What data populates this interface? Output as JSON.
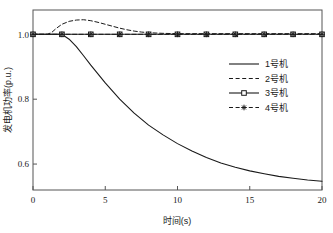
{
  "chart_data": {
    "type": "line",
    "title": "",
    "xlabel": "时间(s)",
    "ylabel": "发电机功率(p.u.)",
    "xlim": [
      0,
      20
    ],
    "ylim": [
      0.52,
      1.075
    ],
    "xticks": [
      0,
      5,
      10,
      15,
      20
    ],
    "xtick_labels": [
      "0",
      "5",
      "10",
      "15",
      "20"
    ],
    "yticks": [
      0.6,
      0.8,
      1.0
    ],
    "ytick_labels": [
      "0.6",
      "0.8",
      "1.0"
    ],
    "grid": false,
    "legend_position": "center-right",
    "series": [
      {
        "name": "1号机",
        "style": "solid",
        "marker": "none",
        "color": "#1a1a1a",
        "x": [
          0,
          1,
          1.5,
          2,
          2.5,
          3,
          3.5,
          4,
          5,
          6,
          7,
          8,
          9,
          10,
          11,
          12,
          13,
          14,
          15,
          16,
          17,
          18,
          19,
          20
        ],
        "y": [
          1.0,
          1.0,
          1.0,
          1.0,
          0.985,
          0.962,
          0.934,
          0.905,
          0.85,
          0.8,
          0.757,
          0.72,
          0.69,
          0.663,
          0.64,
          0.62,
          0.603,
          0.59,
          0.579,
          0.57,
          0.562,
          0.556,
          0.551,
          0.547
        ]
      },
      {
        "name": "2号机",
        "style": "dashed",
        "marker": "none",
        "color": "#1a1a1a",
        "x": [
          0,
          1,
          1.3,
          1.6,
          2,
          2.5,
          3,
          3.5,
          4,
          4.5,
          5,
          5.5,
          6,
          6.5,
          7,
          7.5,
          8,
          9,
          10,
          12,
          14,
          16,
          18,
          20
        ],
        "y": [
          1.0,
          1.0,
          1.006,
          1.018,
          1.031,
          1.04,
          1.044,
          1.045,
          1.042,
          1.037,
          1.031,
          1.025,
          1.019,
          1.014,
          1.01,
          1.007,
          1.005,
          1.003,
          1.002,
          1.002,
          1.002,
          1.002,
          1.002,
          1.002
        ]
      },
      {
        "name": "3号机",
        "style": "solid",
        "marker": "square",
        "color": "#1a1a1a",
        "x": [
          0,
          2,
          4,
          6,
          8,
          10,
          12,
          14,
          16,
          18,
          20
        ],
        "y": [
          1.0,
          1.0,
          1.0,
          1.0,
          1.0,
          1.0,
          1.0,
          1.0,
          1.0,
          1.0,
          1.0
        ]
      },
      {
        "name": "4号机",
        "style": "dashed",
        "marker": "asterisk",
        "color": "#1a1a1a",
        "x": [
          0,
          2,
          4,
          6,
          8,
          10,
          12,
          14,
          16,
          18,
          20
        ],
        "y": [
          1.0,
          1.0,
          1.0,
          1.0,
          1.0,
          1.0,
          1.0,
          1.0,
          1.0,
          1.0,
          1.0
        ]
      }
    ]
  },
  "legend": {
    "items": [
      {
        "label": "1号机"
      },
      {
        "label": "2号机"
      },
      {
        "label": "3号机"
      },
      {
        "label": "4号机"
      }
    ]
  },
  "axes": {
    "x_title": "时间(s)",
    "y_title": "发电机功率(p.u.)"
  }
}
